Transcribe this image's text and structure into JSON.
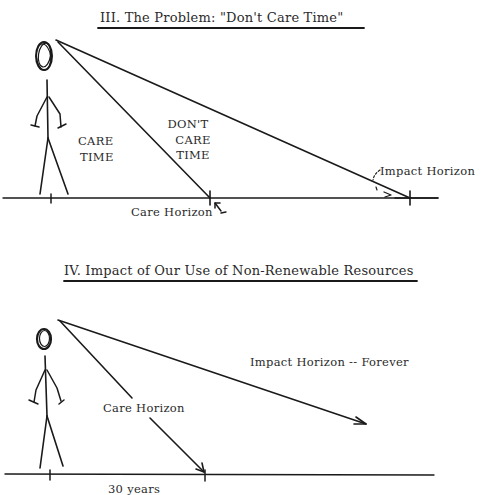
{
  "panel_iii": {
    "title": "III.  The Problem:  \"Don't Care Time\"",
    "labels": {
      "care_time_line1": "CARE",
      "care_time_line2": "TIME",
      "dont_care_line1": "DON'T",
      "dont_care_line2": "CARE",
      "dont_care_line3": "TIME",
      "care_horizon": "Care Horizon",
      "impact_horizon": "Impact Horizon"
    }
  },
  "panel_iv": {
    "title": "IV.  Impact of Our Use of Non-Renewable Resources",
    "labels": {
      "care_horizon": "Care Horizon",
      "impact_horizon": "Impact Horizon -- Forever",
      "duration": "30 years"
    }
  },
  "colors": {
    "ink": "#1a1a1a",
    "text": "#2a2a2a",
    "background": "#ffffff",
    "tick_accent": "#6b1a1a"
  }
}
